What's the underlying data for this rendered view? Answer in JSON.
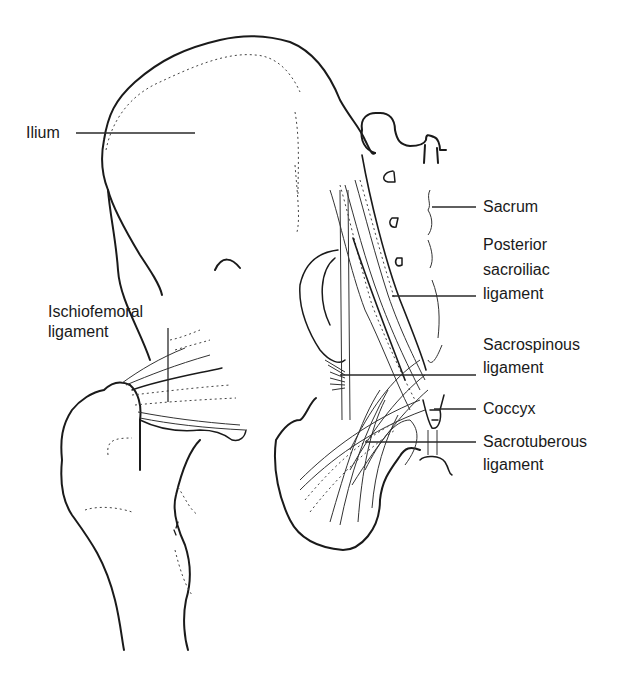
{
  "figure": {
    "labels": {
      "ilium": "Ilium",
      "ischiofemoral_1": "Ischiofemoral",
      "ischiofemoral_2": "ligament",
      "sacrum": "Sacrum",
      "posterior_sacroiliac_1": "Posterior",
      "posterior_sacroiliac_2": "sacroiliac",
      "posterior_sacroiliac_3": "ligament",
      "sacrospinous_1": "Sacrospinous",
      "sacrospinous_2": "ligament",
      "coccyx": "Coccyx",
      "sacrotuberous_1": "Sacrotuberous",
      "sacrotuberous_2": "ligament"
    },
    "colors": {
      "line": "#1a1a1a",
      "background": "#ffffff"
    }
  }
}
